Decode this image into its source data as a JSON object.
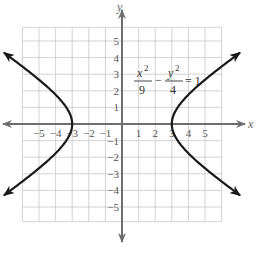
{
  "chart_data": {
    "type": "line",
    "title": "",
    "equation": {
      "x_num": "x",
      "x_exp": "2",
      "x_den": "9",
      "minus": "−",
      "y_num": "y",
      "y_exp": "2",
      "y_den": "4",
      "rhs": "= 1"
    },
    "xlabel": "x",
    "ylabel": "y",
    "xlim": [
      -6,
      6
    ],
    "ylim": [
      -6,
      6
    ],
    "grid": true,
    "x_ticks": [
      {
        "value": -5,
        "label": "−5"
      },
      {
        "value": -4,
        "label": "−4"
      },
      {
        "value": -3,
        "label": "−3"
      },
      {
        "value": -2,
        "label": "−2"
      },
      {
        "value": -1,
        "label": "−1"
      },
      {
        "value": 1,
        "label": "1"
      },
      {
        "value": 2,
        "label": "2"
      },
      {
        "value": 3,
        "label": "3"
      },
      {
        "value": 4,
        "label": "4"
      },
      {
        "value": 5,
        "label": "5"
      }
    ],
    "y_ticks": [
      {
        "value": 5,
        "label": "5"
      },
      {
        "value": 4,
        "label": "4"
      },
      {
        "value": 3,
        "label": "3"
      },
      {
        "value": 2,
        "label": "2"
      },
      {
        "value": 1,
        "label": "1"
      },
      {
        "value": -1,
        "label": "−1"
      },
      {
        "value": -2,
        "label": "−2"
      },
      {
        "value": -3,
        "label": "−3"
      },
      {
        "value": -4,
        "label": "−4"
      },
      {
        "value": -5,
        "label": "−5"
      }
    ],
    "series": [
      {
        "name": "right branch",
        "a": 3,
        "b": 2,
        "sign": 1,
        "y_range": [
          -4.3,
          4.3
        ]
      },
      {
        "name": "left branch",
        "a": 3,
        "b": 2,
        "sign": -1,
        "y_range": [
          -4.3,
          4.3
        ]
      }
    ],
    "colors": {
      "grid": "#c8c8c8",
      "axis": "#6e6e6e",
      "curve": "#1a1a1a"
    }
  }
}
